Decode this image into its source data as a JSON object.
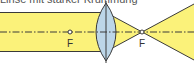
{
  "caption": "Linse mit starker Krümmung",
  "diagram": {
    "type": "optics-converging-lens",
    "beam_color": "#fbf27a",
    "lens_color": "#bcd6e8",
    "outline_color": "#3a3a3a",
    "axis_style": "dash-dot",
    "focal_points": [
      {
        "label": "F",
        "side": "left"
      },
      {
        "label": "F",
        "side": "right"
      }
    ]
  }
}
